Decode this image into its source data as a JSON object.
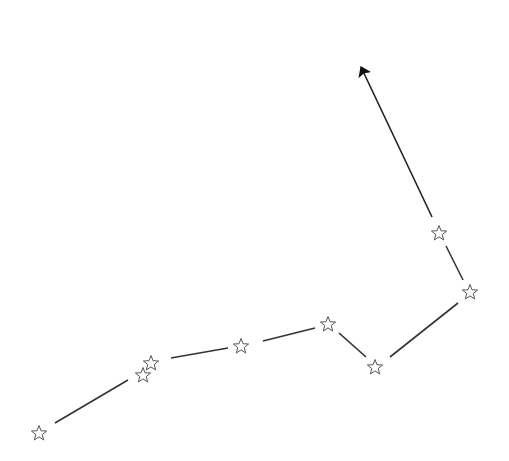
{
  "diagram": {
    "type": "star-path",
    "line_color": "#333333",
    "star_stroke": "#555555",
    "arrow_color": "#111111",
    "stars": [
      {
        "x": 39,
        "y": 433
      },
      {
        "x": 143,
        "y": 375
      },
      {
        "x": 151,
        "y": 363
      },
      {
        "x": 241,
        "y": 346
      },
      {
        "x": 328,
        "y": 324
      },
      {
        "x": 375,
        "y": 367
      },
      {
        "x": 470,
        "y": 292
      },
      {
        "x": 439,
        "y": 233
      }
    ],
    "segments": [
      {
        "x1": 55,
        "y1": 423,
        "x2": 128,
        "y2": 380
      },
      {
        "x1": 171,
        "y1": 358,
        "x2": 228,
        "y2": 348
      },
      {
        "x1": 263,
        "y1": 341,
        "x2": 315,
        "y2": 328
      },
      {
        "x1": 339,
        "y1": 333,
        "x2": 366,
        "y2": 357
      },
      {
        "x1": 390,
        "y1": 357,
        "x2": 458,
        "y2": 303
      },
      {
        "x1": 463,
        "y1": 280,
        "x2": 446,
        "y2": 246
      }
    ],
    "arrow": {
      "x1": 432,
      "y1": 217,
      "x2": 361,
      "y2": 67
    }
  }
}
